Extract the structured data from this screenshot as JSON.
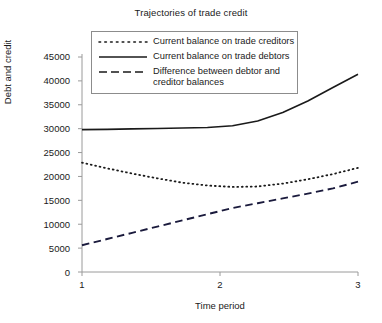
{
  "chart_data": {
    "type": "line",
    "title": "Trajectories of trade credit",
    "xlabel": "Time period",
    "ylabel": "Debt and credit",
    "x": [
      1,
      2,
      3
    ],
    "xtick_labels": [
      "1",
      "2",
      "3"
    ],
    "xlim": [
      1,
      3
    ],
    "ylim": [
      0,
      45000
    ],
    "ytick_labels": [
      "45000",
      "40000",
      "35000",
      "30000",
      "25000",
      "20000",
      "15000",
      "10000",
      "5000",
      "0"
    ],
    "yticks": [
      45000,
      40000,
      35000,
      30000,
      25000,
      20000,
      15000,
      10000,
      5000,
      0
    ],
    "grid": false,
    "legend_position": "upper center",
    "series": [
      {
        "name": "Current balance on trade creditors",
        "style": "dotted",
        "color": "#1a1a1a",
        "values": [
          22900,
          17800,
          21800
        ],
        "dense": [
          22900,
          21700,
          20600,
          19600,
          18700,
          18100,
          17800,
          17900,
          18500,
          19400,
          20500,
          21800
        ]
      },
      {
        "name": "Current balance on trade debtors",
        "style": "solid",
        "color": "#1a1a1a",
        "values": [
          29800,
          30200,
          41400
        ],
        "dense": [
          29800,
          29850,
          29950,
          30050,
          30150,
          30250,
          30600,
          31600,
          33400,
          35800,
          38600,
          41400
        ]
      },
      {
        "name": "Difference between debtor and creditor balances",
        "style": "dashed",
        "color": "#1a1a3c",
        "values": [
          5600,
          13400,
          18900
        ],
        "dense": [
          5600,
          6900,
          8200,
          9500,
          10800,
          12100,
          13400,
          14400,
          15400,
          16400,
          17500,
          18900
        ]
      }
    ],
    "legend_entries": [
      "Current balance on trade creditors",
      "Current balance on trade debtors",
      "Difference between debtor and",
      "creditor balances"
    ]
  },
  "axis_colors": {
    "axis_line": "#9a9a9a",
    "text": "#1a1a1a",
    "legend_border": "#8c8c8c"
  }
}
